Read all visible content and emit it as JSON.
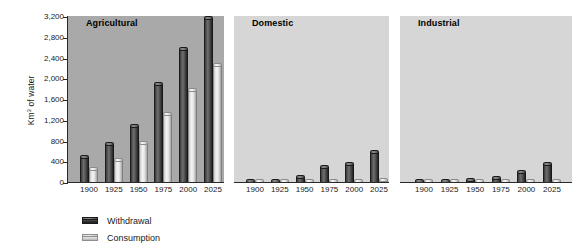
{
  "chart_data": {
    "type": "bar",
    "title": "",
    "xlabel": "",
    "ylabel": "Km3 of water",
    "ylabel_display": "Km³ of water",
    "ylim": [
      0,
      3200
    ],
    "ytick_values": [
      0,
      400,
      800,
      1200,
      1600,
      2000,
      2400,
      2800,
      3200
    ],
    "ytick_labels": [
      "0",
      "400",
      "800",
      "1,200",
      "1,600",
      "2,000",
      "2,400",
      "2,800",
      "3,200"
    ],
    "grid": false,
    "legend_position": "below-left",
    "categories": [
      "1900",
      "1925",
      "1950",
      "1975",
      "2000",
      "2025"
    ],
    "series_names": [
      "Withdrawal",
      "Consumption"
    ],
    "panels": [
      {
        "name": "Agricultural",
        "background_color": "#a9a9a9",
        "series": [
          {
            "name": "Withdrawal",
            "values": [
              530,
              770,
              1120,
              1920,
              2600,
              3200
            ]
          },
          {
            "name": "Consumption",
            "values": [
              290,
              470,
              800,
              1350,
              1820,
              2300
            ]
          }
        ]
      },
      {
        "name": "Domestic",
        "background_color": "#d6d6d6",
        "series": [
          {
            "name": "Withdrawal",
            "values": [
              20,
              55,
              130,
              320,
              390,
              620
            ]
          },
          {
            "name": "Consumption",
            "values": [
              10,
              20,
              30,
              50,
              60,
              80
            ]
          }
        ]
      },
      {
        "name": "Industrial",
        "background_color": "#d6d6d6",
        "series": [
          {
            "name": "Withdrawal",
            "values": [
              10,
              40,
              75,
              120,
              240,
              390
            ]
          },
          {
            "name": "Consumption",
            "values": [
              5,
              10,
              15,
              20,
              30,
              45
            ]
          }
        ]
      }
    ]
  },
  "legend": {
    "items": [
      {
        "label": "Withdrawal",
        "swatch": "dark",
        "color": "#303030"
      },
      {
        "label": "Consumption",
        "swatch": "light",
        "color": "#d2d2d2"
      }
    ]
  },
  "axis": {
    "y_title": "Km³ of water",
    "y_title_base": "Km",
    "y_title_sup": "3",
    "y_title_tail": " of water"
  }
}
